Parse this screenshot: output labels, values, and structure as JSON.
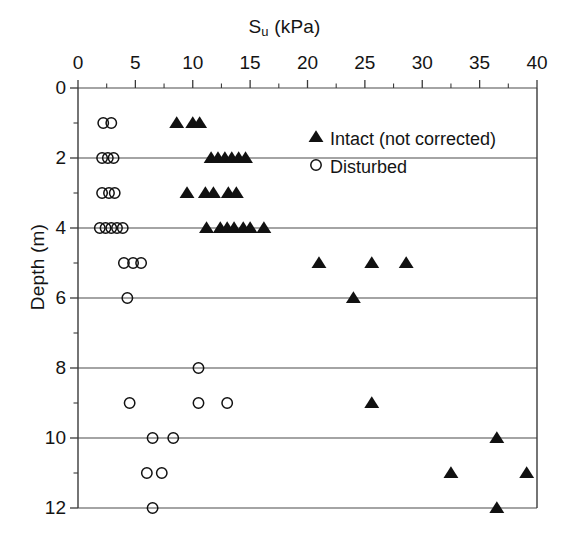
{
  "chart_data": {
    "type": "scatter",
    "title": "",
    "xlabel": "Su (kPa)",
    "xlabel_main": "S",
    "xlabel_sub": "u",
    "xlabel_unit": " (kPa)",
    "ylabel": "Depth (m)",
    "xlim": [
      0,
      40
    ],
    "ylim": [
      0,
      12
    ],
    "y_inverted": true,
    "grid": "horizontal-major-only",
    "legend_position": "upper-right-inside",
    "x_ticks": [
      0,
      5,
      10,
      15,
      20,
      25,
      30,
      35,
      40
    ],
    "x_tick_labels": [
      "0",
      "5",
      "10",
      "15",
      "20",
      "25",
      "30",
      "35",
      "40"
    ],
    "x_minor_ticks": [
      2.5,
      7.5,
      12.5,
      17.5,
      22.5,
      27.5,
      32.5,
      37.5
    ],
    "y_ticks": [
      0,
      2,
      4,
      6,
      8,
      10,
      12
    ],
    "y_tick_labels": [
      "0",
      "2",
      "4",
      "6",
      "8",
      "10",
      "12"
    ],
    "y_minor_ticks": [
      1,
      3,
      5,
      7,
      9,
      11
    ],
    "series": [
      {
        "name": "Intact (not corrected)",
        "marker": "filled-triangle",
        "color": "#111111",
        "points": [
          {
            "x": 8.6,
            "y": 1
          },
          {
            "x": 10.0,
            "y": 1
          },
          {
            "x": 10.6,
            "y": 1
          },
          {
            "x": 11.6,
            "y": 2
          },
          {
            "x": 12.2,
            "y": 2
          },
          {
            "x": 12.8,
            "y": 2
          },
          {
            "x": 13.4,
            "y": 2
          },
          {
            "x": 14.0,
            "y": 2
          },
          {
            "x": 14.6,
            "y": 2
          },
          {
            "x": 9.5,
            "y": 3
          },
          {
            "x": 11.1,
            "y": 3
          },
          {
            "x": 11.8,
            "y": 3
          },
          {
            "x": 13.1,
            "y": 3
          },
          {
            "x": 13.8,
            "y": 3
          },
          {
            "x": 11.2,
            "y": 4
          },
          {
            "x": 12.4,
            "y": 4
          },
          {
            "x": 13.0,
            "y": 4
          },
          {
            "x": 13.6,
            "y": 4
          },
          {
            "x": 14.4,
            "y": 4
          },
          {
            "x": 15.0,
            "y": 4
          },
          {
            "x": 16.2,
            "y": 4
          },
          {
            "x": 21.0,
            "y": 5
          },
          {
            "x": 25.6,
            "y": 5
          },
          {
            "x": 28.6,
            "y": 5
          },
          {
            "x": 24.0,
            "y": 6
          },
          {
            "x": 25.6,
            "y": 9
          },
          {
            "x": 36.5,
            "y": 10
          },
          {
            "x": 32.5,
            "y": 11
          },
          {
            "x": 39.1,
            "y": 11
          },
          {
            "x": 36.5,
            "y": 12
          }
        ]
      },
      {
        "name": "Disturbed",
        "marker": "open-circle",
        "color": "#111111",
        "points": [
          {
            "x": 2.2,
            "y": 1
          },
          {
            "x": 2.9,
            "y": 1
          },
          {
            "x": 2.1,
            "y": 2
          },
          {
            "x": 2.6,
            "y": 2
          },
          {
            "x": 3.1,
            "y": 2
          },
          {
            "x": 2.1,
            "y": 3
          },
          {
            "x": 2.7,
            "y": 3
          },
          {
            "x": 3.2,
            "y": 3
          },
          {
            "x": 1.9,
            "y": 4
          },
          {
            "x": 2.4,
            "y": 4
          },
          {
            "x": 2.9,
            "y": 4
          },
          {
            "x": 3.4,
            "y": 4
          },
          {
            "x": 3.9,
            "y": 4
          },
          {
            "x": 4.0,
            "y": 5
          },
          {
            "x": 4.8,
            "y": 5
          },
          {
            "x": 5.5,
            "y": 5
          },
          {
            "x": 4.3,
            "y": 6
          },
          {
            "x": 10.5,
            "y": 8
          },
          {
            "x": 4.5,
            "y": 9
          },
          {
            "x": 10.5,
            "y": 9
          },
          {
            "x": 13.0,
            "y": 9
          },
          {
            "x": 6.5,
            "y": 10
          },
          {
            "x": 8.3,
            "y": 10
          },
          {
            "x": 6.0,
            "y": 11
          },
          {
            "x": 7.3,
            "y": 11
          },
          {
            "x": 6.5,
            "y": 12
          }
        ]
      }
    ],
    "legend": [
      {
        "label": "Intact (not corrected)",
        "marker": "filled-triangle"
      },
      {
        "label": "Disturbed",
        "marker": "open-circle"
      }
    ]
  },
  "colors": {
    "axis": "#3a3a3a",
    "grid": "#4a4a4a",
    "marker": "#111111",
    "text": "#141414",
    "background": "#ffffff"
  }
}
